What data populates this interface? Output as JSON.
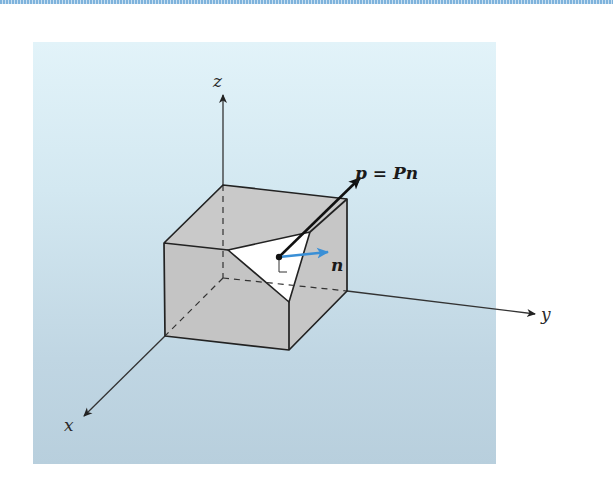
{
  "figure": {
    "axes": {
      "x_label": "x",
      "y_label": "y",
      "z_label": "z"
    },
    "point_label": "P",
    "traction_equation": "p = Pn",
    "normal_label": "n",
    "colors": {
      "panel_top": "#e2f3f9",
      "panel_bottom": "#b8cfdd",
      "cube_face": "#c8c8c8",
      "cut_face": "#ffffff",
      "normal_arrow": "#3a8fd6",
      "traction_arrow": "#111111",
      "axis_line": "#333333",
      "top_strip": "#7fb3dc"
    }
  }
}
